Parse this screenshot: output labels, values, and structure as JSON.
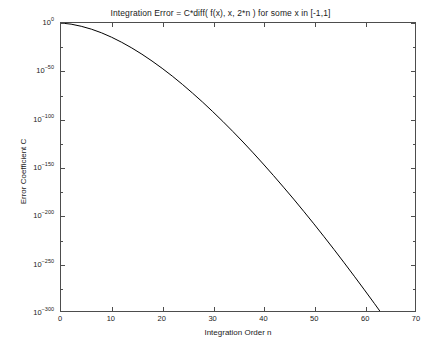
{
  "chart_data": {
    "type": "line",
    "title": "Integration Error = C*diff( f(x), x, 2*n ) for some x in [-1,1]",
    "xlabel": "Integration Order n",
    "ylabel": "Error Coefficient C",
    "xlim": [
      0,
      70
    ],
    "ylim_exponent": [
      -300,
      0
    ],
    "yscale": "log",
    "grid": false,
    "legend": null,
    "xticks": [
      "0",
      "10",
      "20",
      "30",
      "40",
      "50",
      "60",
      "70"
    ],
    "xtick_values": [
      0,
      10,
      20,
      30,
      40,
      50,
      60,
      70
    ],
    "yticks": [
      "10^0",
      "10^-50",
      "10^-100",
      "10^-150",
      "10^-200",
      "10^-250",
      "10^-300"
    ],
    "ytick_bases": [
      "10",
      "10",
      "10",
      "10",
      "10",
      "10",
      "10"
    ],
    "ytick_exponents": [
      "0",
      "-50",
      "-100",
      "-150",
      "-200",
      "-250",
      "-300"
    ],
    "ytick_values": [
      0,
      -50,
      -100,
      -150,
      -200,
      -250,
      -300
    ],
    "series": [
      {
        "name": "Error Coefficient C",
        "color": "#000000",
        "x": [
          0,
          2,
          4,
          6,
          8,
          10,
          12,
          14,
          16,
          18,
          20,
          22,
          24,
          26,
          28,
          30,
          32,
          34,
          36,
          38,
          40,
          42,
          44,
          46,
          48,
          50,
          52,
          54,
          56,
          58,
          60,
          62,
          64,
          66,
          68,
          70
        ],
        "y_exponent": [
          0,
          -1.2,
          -3.4,
          -6.4,
          -10.2,
          -14.8,
          -20.1,
          -26.0,
          -32.5,
          -39.6,
          -47.2,
          -55.3,
          -63.9,
          -73.0,
          -82.4,
          -92.3,
          -102.5,
          -113.1,
          -124.0,
          -135.3,
          -146.9,
          -158.8,
          -171.0,
          -183.4,
          -196.2,
          -209.2,
          -222.5,
          -236.0,
          -249.8,
          -263.8,
          -278.0,
          -292.4,
          -307.0,
          -321.8,
          -336.8,
          -352.0
        ]
      }
    ]
  }
}
